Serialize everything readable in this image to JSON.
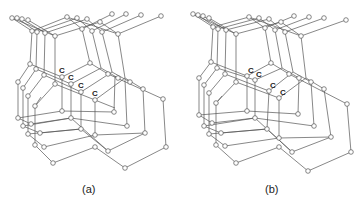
{
  "figure": {
    "panels": [
      {
        "id": "a",
        "caption": "(a)",
        "atom_labels": [
          "C",
          "C",
          "C",
          "C"
        ]
      },
      {
        "id": "b",
        "caption": "(b)",
        "atom_labels": [
          "C",
          "C",
          "C",
          "C"
        ]
      }
    ],
    "colors": {
      "bond": "#555555",
      "atom_fill": "#ffffff",
      "text": "#222222"
    }
  }
}
